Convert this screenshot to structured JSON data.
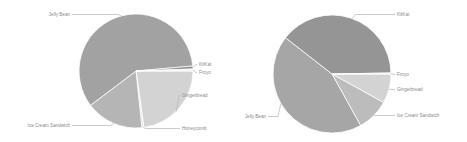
{
  "chart_data": [
    {
      "type": "pie",
      "title": "",
      "center": [
        136,
        71
      ],
      "radius": 57,
      "legend": "none (callout labels)",
      "slices": [
        {
          "label": "Gingerbread",
          "value": 22.8,
          "start_deg": 0,
          "end_deg": 82,
          "color": "#d3d3d3",
          "label_pos": [
            182,
            97
          ],
          "leader_from_deg": 45,
          "label_anchor": "start"
        },
        {
          "label": "Honeycomb",
          "value": 0.6,
          "start_deg": 82,
          "end_deg": 84,
          "color": "#e2e2e2",
          "label_pos": [
            182,
            130
          ],
          "leader_from_deg": 83,
          "label_anchor": "start"
        },
        {
          "label": "Ice Cream Sandwich",
          "value": 16.4,
          "start_deg": 84,
          "end_deg": 143,
          "color": "#b5b5b5",
          "label_pos": [
            70,
            127
          ],
          "leader_from_deg": 113,
          "label_anchor": "end"
        },
        {
          "label": "Jelly Bean",
          "value": 58.9,
          "start_deg": 143,
          "end_deg": 355,
          "color": "#a2a2a2",
          "label_pos": [
            70,
            16
          ],
          "leader_from_deg": 255,
          "label_anchor": "end"
        },
        {
          "label": "KitKat",
          "value": 0.8,
          "start_deg": 355,
          "end_deg": 358,
          "color": "#8c8c8c",
          "label_pos": [
            199,
            66
          ],
          "leader_from_deg": 356.5,
          "label_anchor": "start"
        },
        {
          "label": "Froyo",
          "value": 0.6,
          "start_deg": 358,
          "end_deg": 360,
          "color": "#efefef",
          "label_pos": [
            199,
            74
          ],
          "leader_from_deg": 359,
          "label_anchor": "start"
        }
      ]
    },
    {
      "type": "pie",
      "title": "",
      "center": [
        332,
        74
      ],
      "radius": 59,
      "legend": "none (callout labels)",
      "slices": [
        {
          "label": "Gingerbread",
          "value": 8.0,
          "start_deg": 0,
          "end_deg": 29,
          "color": "#d3d3d3",
          "label_pos": [
            397,
            91
          ],
          "leader_from_deg": 15,
          "label_anchor": "start"
        },
        {
          "label": "Ice Cream Sandwich",
          "value": 8.9,
          "start_deg": 29,
          "end_deg": 61,
          "color": "#bcbcbc",
          "label_pos": [
            397,
            117
          ],
          "leader_from_deg": 45,
          "label_anchor": "start"
        },
        {
          "label": "Jelly Bean",
          "value": 43.6,
          "start_deg": 61,
          "end_deg": 218,
          "color": "#a6a6a6",
          "label_pos": [
            266,
            118
          ],
          "leader_from_deg": 150,
          "label_anchor": "end"
        },
        {
          "label": "KitKat",
          "value": 39.2,
          "start_deg": 218,
          "end_deg": 359,
          "color": "#959595",
          "label_pos": [
            397,
            16
          ],
          "leader_from_deg": 290,
          "label_anchor": "start"
        },
        {
          "label": "Froyo",
          "value": 0.3,
          "start_deg": 359,
          "end_deg": 360,
          "color": "#eeeeee",
          "label_pos": [
            397,
            76
          ],
          "leader_from_deg": 359.5,
          "label_anchor": "start"
        }
      ]
    }
  ]
}
